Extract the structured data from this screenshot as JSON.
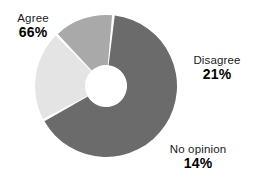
{
  "chart_data": {
    "type": "pie",
    "variant": "donut",
    "title": "",
    "subtitle": "",
    "xlabel": "",
    "ylabel": "",
    "grid": false,
    "legend_position": "outside-labels",
    "units": "percent",
    "total": 101,
    "hole_ratio": 0.295,
    "start_angle_deg": 6,
    "direction": "clockwise",
    "gap_deg": 2.2,
    "categories": [
      "Agree",
      "Disagree",
      "No opinion"
    ],
    "values": [
      66,
      21,
      14
    ],
    "labels": [
      "66%",
      "21%",
      "14%"
    ],
    "colors": [
      "#6b6b6b",
      "#e4e4e4",
      "#a9a9a9"
    ],
    "slices": [
      {
        "name": "Agree",
        "value": 66,
        "value_label": "66%",
        "color": "#6b6b6b",
        "label_position": "upper-left"
      },
      {
        "name": "Disagree",
        "value": 21,
        "value_label": "21%",
        "color": "#e4e4e4",
        "label_position": "right"
      },
      {
        "name": "No opinion",
        "value": 14,
        "value_label": "14%",
        "color": "#a9a9a9",
        "label_position": "lower-right"
      }
    ],
    "geometry": {
      "center_x": 106,
      "center_y": 86,
      "outer_radius": 71,
      "inner_radius": 21
    },
    "style": {
      "background": "#ffffff",
      "separator_color": "#ffffff",
      "text_color": "#000000",
      "name_color": "#1a1a1a"
    }
  }
}
